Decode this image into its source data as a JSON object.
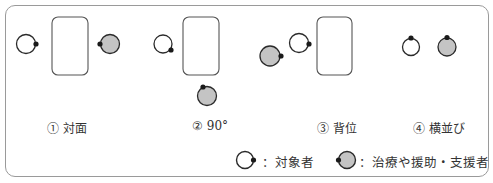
{
  "colors": {
    "outline": "#2a2a2a",
    "person_fill": "#ffffff",
    "supporter_fill": "#c4c4c4",
    "table_stroke": "#555555",
    "frame_stroke": "#9a9a9a"
  },
  "positions": [
    {
      "id": 1,
      "label": "① 対面",
      "description": "face-to-face: subject and supporter on opposite sides of table"
    },
    {
      "id": 2,
      "label": "② 90°",
      "description": "supporter at 90 degrees to subject"
    },
    {
      "id": 3,
      "label": "③ 背位",
      "description": "supporter behind subject"
    },
    {
      "id": 4,
      "label": "④ 横並び",
      "description": "side by side"
    }
  ],
  "legend": {
    "subject": {
      "icon": "white-circle-with-dot",
      "text": "：対象者"
    },
    "supporter": {
      "icon": "gray-circle-with-dot",
      "text": "：治療や援助・支援者"
    }
  }
}
